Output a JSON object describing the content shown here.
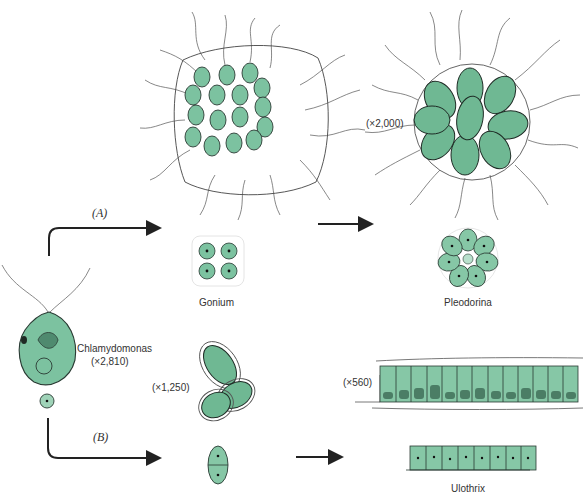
{
  "diagram": {
    "colors": {
      "cell_fill": "#7cc2a0",
      "cell_fill_light": "#9fd3b8",
      "outline": "#2a3a33",
      "arrow": "#222222",
      "text": "#333333"
    },
    "pathways": [
      {
        "id": "A",
        "label": "(A)"
      },
      {
        "id": "B",
        "label": "(B)"
      }
    ],
    "organisms": {
      "chlamydomonas": {
        "name": "Chlamydomonas",
        "magnification": "(×2,810)"
      },
      "gonium": {
        "name": "Gonium"
      },
      "pleodorina": {
        "name": "Pleodorina",
        "magnification": "(×2,000)"
      },
      "tetraspora": {
        "magnification": "(×1,250)"
      },
      "ulothrix": {
        "name": "Ulothrix",
        "magnification": "(×560)"
      }
    }
  }
}
